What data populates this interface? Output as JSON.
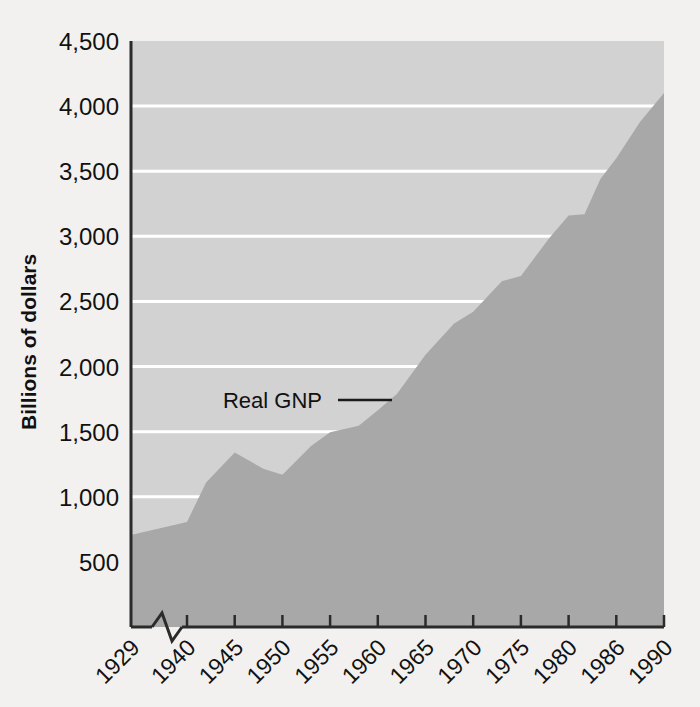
{
  "chart_data": {
    "type": "area",
    "title": "",
    "subtitle": "",
    "xlabel": "",
    "ylabel": "Billions of dollars",
    "ylim": [
      0,
      4500
    ],
    "ytick_values": [
      500,
      1000,
      1500,
      2000,
      2500,
      3000,
      3500,
      4000,
      4500
    ],
    "ytick_labels": [
      "500",
      "1,000",
      "1,500",
      "2,000",
      "2,500",
      "3,000",
      "3,500",
      "4,000",
      "4,500"
    ],
    "xtick_labels": [
      "1929",
      "1940",
      "1945",
      "1950",
      "1955",
      "1960",
      "1965",
      "1970",
      "1975",
      "1980",
      "1986",
      "1990"
    ],
    "axis_break_between": [
      "1929",
      "1940"
    ],
    "grid": true,
    "grid_color": "#ffffff",
    "legend_position": "inline-annotation",
    "series": [
      {
        "name": "Real GNP",
        "x": [
          1929,
          1940,
          1945,
          1950,
          1955,
          1960,
          1965,
          1970,
          1975,
          1980,
          1986,
          1990
        ],
        "values": [
          707,
          807,
          1340,
          1170,
          1495,
          1665,
          2090,
          2420,
          2695,
          3160,
          3600,
          4100
        ]
      }
    ],
    "detail_points": [
      {
        "year": 1929,
        "value": 707
      },
      {
        "year": 1940,
        "value": 807
      },
      {
        "year": 1942,
        "value": 1110
      },
      {
        "year": 1945,
        "value": 1340
      },
      {
        "year": 1948,
        "value": 1215
      },
      {
        "year": 1950,
        "value": 1170
      },
      {
        "year": 1953,
        "value": 1390
      },
      {
        "year": 1955,
        "value": 1495
      },
      {
        "year": 1958,
        "value": 1545
      },
      {
        "year": 1960,
        "value": 1665
      },
      {
        "year": 1962,
        "value": 1790
      },
      {
        "year": 1965,
        "value": 2090
      },
      {
        "year": 1968,
        "value": 2330
      },
      {
        "year": 1970,
        "value": 2420
      },
      {
        "year": 1973,
        "value": 2655
      },
      {
        "year": 1975,
        "value": 2695
      },
      {
        "year": 1978,
        "value": 2990
      },
      {
        "year": 1980,
        "value": 3160
      },
      {
        "year": 1982,
        "value": 3170
      },
      {
        "year": 1984,
        "value": 3440
      },
      {
        "year": 1986,
        "value": 3600
      },
      {
        "year": 1988,
        "value": 3880
      },
      {
        "year": 1990,
        "value": 4100
      }
    ],
    "annotations": [
      {
        "label": "Real GNP",
        "leader_line": true
      }
    ],
    "colors": {
      "plot_background": "#d2d2d2",
      "area_fill": "#a8a8a8",
      "gridline": "#ffffff",
      "axis": "#2b2b2b",
      "page_background": "#f2f1ef",
      "text": "#111111"
    }
  }
}
